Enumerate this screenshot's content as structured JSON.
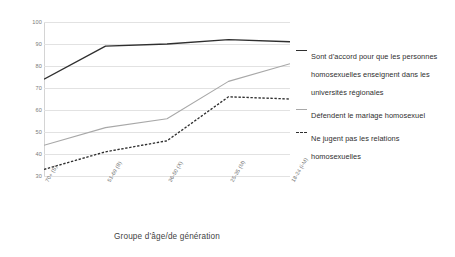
{
  "chart_data": {
    "type": "line",
    "title": "",
    "xlabel": "Groupe d’âge/de génération",
    "ylabel": "",
    "ylim": [
      30,
      100
    ],
    "ytick_step": 10,
    "yticks": [
      100,
      90,
      80,
      70,
      60,
      50,
      40,
      30
    ],
    "grid": true,
    "legend_position": "right",
    "categories": [
      "70+ (S)",
      "51-69 (B)",
      "36-50 (X)",
      "25-35 (M)",
      "18-24 (i-M)"
    ],
    "series": [
      {
        "name": "Sont d’accord pour que les personnes homosexuelles enseignent dans les universités régionales",
        "style": "solid",
        "color": "#2f2f2f",
        "values": [
          74,
          89,
          90,
          92,
          91
        ]
      },
      {
        "name": "Défendent le mariage homosexuel",
        "style": "solid",
        "color": "#a8a8a8",
        "values": [
          44,
          52,
          56,
          73,
          81
        ]
      },
      {
        "name": "Ne jugent pas les relations homosexuelles",
        "style": "dashed",
        "color": "#2f2f2f",
        "values": [
          33,
          41,
          46,
          66,
          65
        ]
      }
    ]
  },
  "legend": {
    "entries": [
      {
        "label": "Sont d’accord pour que les personnes homosexuelles enseignent dans les universités régionales",
        "swatch": "solid-dark"
      },
      {
        "label": "Défendent le mariage homosexuel",
        "swatch": "solid-gray"
      },
      {
        "label": "Ne jugent pas les relations homosexuelles",
        "swatch": "dashed-dark"
      }
    ]
  }
}
